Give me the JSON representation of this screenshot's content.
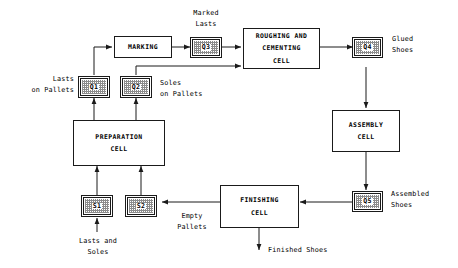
{
  "diagram": {
    "type": "flowchart",
    "line_color": "#1a1a1a",
    "fill_color": "#ffffff",
    "hatch_color": "#8b8b8b"
  },
  "process_boxes": [
    {
      "id": "marking",
      "lines": [
        "MARKING"
      ]
    },
    {
      "id": "roughing",
      "lines": [
        "ROUGHING AND",
        "CEMENTING",
        "CELL"
      ]
    },
    {
      "id": "assembly",
      "lines": [
        "ASSEMBLY",
        "CELL"
      ]
    },
    {
      "id": "preparation",
      "lines": [
        "PREPARATION",
        "CELL"
      ]
    },
    {
      "id": "finishing",
      "lines": [
        "FINISHING",
        "CELL"
      ]
    }
  ],
  "buffers": [
    {
      "id": "q1",
      "label": "Q1"
    },
    {
      "id": "q2",
      "label": "Q2"
    },
    {
      "id": "q3",
      "label": "Q3"
    },
    {
      "id": "q4",
      "label": "Q4"
    },
    {
      "id": "q5",
      "label": "Q5"
    },
    {
      "id": "s1",
      "label": "S1"
    },
    {
      "id": "s2",
      "label": "S2"
    }
  ],
  "captions": {
    "marked_lasts": "Marked\nLasts",
    "glued_shoes": "Glued\nShoes",
    "lasts_on_pallets": "Lasts\non Pallets",
    "soles_on_pallets": "Soles\non Pallets",
    "assembled_shoes": "Assembled\nShoes",
    "empty_pallets": "Empty\nPallets",
    "lasts_and_soles": "Lasts and\nSoles",
    "finished_shoes": "Finished Shoes"
  }
}
